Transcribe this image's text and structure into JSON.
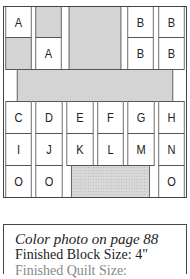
{
  "diagram": {
    "rows": [
      [
        "A",
        "",
        "",
        "",
        "B",
        "B"
      ],
      [
        "",
        "A",
        "",
        "",
        "B",
        "B"
      ],
      [
        "",
        "",
        "",
        "",
        "",
        ""
      ],
      [
        "C",
        "D",
        "E",
        "F",
        "G",
        "H"
      ],
      [
        "I",
        "J",
        "K",
        "L",
        "M",
        "N"
      ],
      [
        "O",
        "O",
        "",
        "",
        "",
        "O"
      ]
    ],
    "cells": {
      "r0c0": "A",
      "r1c1": "A",
      "r0c4": "B",
      "r0c5": "B",
      "r1c4": "B",
      "r1c5": "B",
      "r3c0": "C",
      "r3c1": "D",
      "r3c2": "E",
      "r3c3": "F",
      "r3c4": "G",
      "r3c5": "H",
      "r4c0": "I",
      "r4c1": "J",
      "r4c2": "K",
      "r4c3": "L",
      "r4c4": "M",
      "r4c5": "N",
      "r5c0": "O",
      "r5c1": "O",
      "r5c5": "O"
    },
    "colors": {
      "gray": "#d4d4d4",
      "border": "#555555",
      "white": "#ffffff"
    }
  },
  "caption": {
    "line1": "Color photo on page 88",
    "line2": "Finished Block Size: 4\"",
    "line3": "Finished Quilt Size:"
  }
}
